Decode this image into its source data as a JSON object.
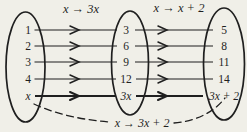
{
  "figure": {
    "map1_label": "x → 3x",
    "map2_label": "x → x + 2",
    "composite_label": "x → 3x + 2"
  },
  "sets": {
    "domain": [
      "1",
      "2",
      "3",
      "4",
      "x"
    ],
    "midrange": [
      "3",
      "6",
      "9",
      "12",
      "3x"
    ],
    "range": [
      "5",
      "8",
      "11",
      "14",
      "3x + 2"
    ]
  },
  "colors": {
    "ink": "#1f1f1f",
    "paper": "#f0efe8"
  }
}
